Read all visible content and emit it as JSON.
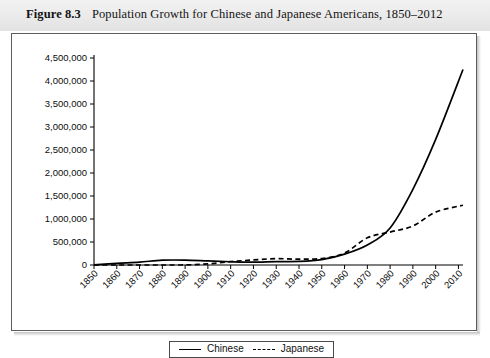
{
  "caption": {
    "figure_number": "Figure 8.3",
    "title": "Population Growth for Chinese and Japanese Americans, 1850–2012"
  },
  "legend": {
    "chinese_label": "Chinese",
    "japanese_label": "Japanese"
  },
  "chart_data": {
    "type": "line",
    "title": "Population Growth for Chinese and Japanese Americans, 1850–2012",
    "xlabel": "",
    "ylabel": "",
    "grid": false,
    "legend_position": "bottom",
    "xlim": [
      1850,
      2012
    ],
    "ylim": [
      0,
      4500000
    ],
    "x_tick_labels": [
      "1850",
      "1860",
      "1870",
      "1880",
      "1890",
      "1900",
      "1910",
      "1920",
      "1930",
      "1940",
      "1950",
      "1960",
      "1970",
      "1980",
      "1990",
      "2000",
      "2010"
    ],
    "y_tick_labels": [
      "0",
      "500,000",
      "1,000,000",
      "1,500,000",
      "2,000,000",
      "2,500,000",
      "3,000,000",
      "3,500,000",
      "4,000,000",
      "4,500,000"
    ],
    "y_tick_values": [
      0,
      500000,
      1000000,
      1500000,
      2000000,
      2500000,
      3000000,
      3500000,
      4000000,
      4500000
    ],
    "x": [
      1850,
      1860,
      1870,
      1880,
      1890,
      1900,
      1910,
      1920,
      1930,
      1940,
      1950,
      1960,
      1970,
      1980,
      1990,
      2000,
      2012
    ],
    "series": [
      {
        "name": "Chinese",
        "style": "solid",
        "color": "#000000",
        "values": [
          1000,
          35000,
          63000,
          105000,
          107000,
          89000,
          71000,
          61000,
          74000,
          77000,
          117000,
          237000,
          435000,
          806000,
          1645000,
          2730000,
          4250000
        ]
      },
      {
        "name": "Japanese",
        "style": "dashed",
        "color": "#000000",
        "values": [
          0,
          0,
          0,
          150,
          2000,
          24000,
          72000,
          111000,
          138000,
          127000,
          141000,
          260000,
          591000,
          716000,
          848000,
          1149000,
          1300000
        ]
      }
    ]
  }
}
